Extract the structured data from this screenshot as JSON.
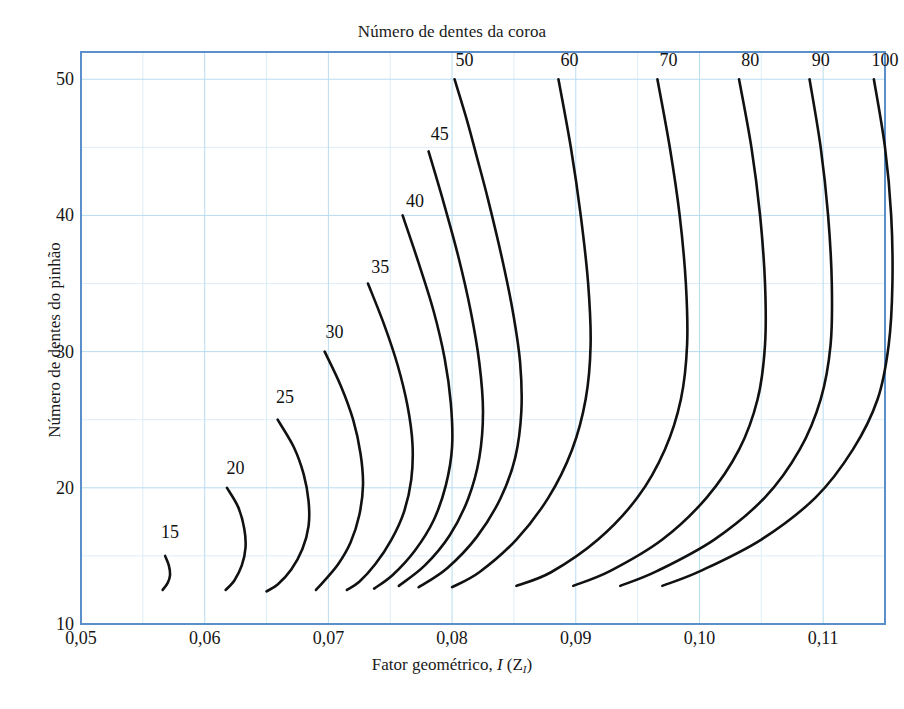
{
  "chart_data": {
    "type": "line",
    "title": "Número de dentes da coroa",
    "xlabel": "Fator geométrico, I (Z_I)",
    "ylabel": "Número de dentes do pinhão",
    "xlim": [
      0.05,
      0.115
    ],
    "ylim": [
      10,
      52
    ],
    "grid": true,
    "legend": "inline-curve-labels",
    "x_ticks": [
      "0,05",
      "0,06",
      "0,07",
      "0,08",
      "0,09",
      "0,10",
      "0,11"
    ],
    "x_tick_values": [
      0.05,
      0.06,
      0.07,
      0.08,
      0.09,
      0.1,
      0.11
    ],
    "y_ticks": [
      "10",
      "20",
      "30",
      "40",
      "50"
    ],
    "y_tick_values": [
      10,
      20,
      30,
      40,
      50
    ],
    "x_minor_step": 0.005,
    "y_minor_step": 5,
    "series": [
      {
        "name": "15",
        "label": "15",
        "label_x": 0.0572,
        "label_y": 16.6,
        "points": [
          [
            0.0568,
            15.0
          ],
          [
            0.0571,
            14.3
          ],
          [
            0.0572,
            13.6
          ],
          [
            0.057,
            13.0
          ],
          [
            0.0566,
            12.5
          ]
        ]
      },
      {
        "name": "20",
        "label": "20",
        "label_x": 0.0625,
        "label_y": 21.3,
        "points": [
          [
            0.0618,
            20.0
          ],
          [
            0.0627,
            18.6
          ],
          [
            0.0632,
            17.0
          ],
          [
            0.0633,
            15.6
          ],
          [
            0.063,
            14.3
          ],
          [
            0.0624,
            13.2
          ],
          [
            0.0617,
            12.5
          ]
        ]
      },
      {
        "name": "25",
        "label": "25",
        "label_x": 0.0665,
        "label_y": 26.5,
        "points": [
          [
            0.0659,
            25.0
          ],
          [
            0.0672,
            23.0
          ],
          [
            0.068,
            21.0
          ],
          [
            0.0684,
            19.0
          ],
          [
            0.0684,
            17.2
          ],
          [
            0.0679,
            15.5
          ],
          [
            0.067,
            14.0
          ],
          [
            0.0659,
            12.9
          ],
          [
            0.065,
            12.4
          ]
        ]
      },
      {
        "name": "30",
        "label": "30",
        "label_x": 0.0705,
        "label_y": 31.3,
        "points": [
          [
            0.0697,
            30.0
          ],
          [
            0.071,
            27.5
          ],
          [
            0.072,
            25.0
          ],
          [
            0.0726,
            22.5
          ],
          [
            0.0728,
            20.2
          ],
          [
            0.0725,
            18.0
          ],
          [
            0.0718,
            16.0
          ],
          [
            0.0708,
            14.4
          ],
          [
            0.0697,
            13.2
          ],
          [
            0.069,
            12.5
          ]
        ]
      },
      {
        "name": "35",
        "label": "35",
        "label_x": 0.0742,
        "label_y": 36.1,
        "points": [
          [
            0.0732,
            35.0
          ],
          [
            0.0745,
            32.0
          ],
          [
            0.0756,
            29.0
          ],
          [
            0.0764,
            26.0
          ],
          [
            0.0768,
            23.2
          ],
          [
            0.0767,
            20.6
          ],
          [
            0.0761,
            18.2
          ],
          [
            0.0751,
            16.2
          ],
          [
            0.0738,
            14.4
          ],
          [
            0.0725,
            13.1
          ],
          [
            0.0715,
            12.5
          ]
        ]
      },
      {
        "name": "40",
        "label": "40",
        "label_x": 0.077,
        "label_y": 40.9,
        "points": [
          [
            0.076,
            40.0
          ],
          [
            0.0773,
            36.5
          ],
          [
            0.0785,
            33.0
          ],
          [
            0.0794,
            29.5
          ],
          [
            0.0799,
            26.2
          ],
          [
            0.08,
            23.0
          ],
          [
            0.0795,
            20.2
          ],
          [
            0.0785,
            17.6
          ],
          [
            0.077,
            15.4
          ],
          [
            0.0752,
            13.6
          ],
          [
            0.0737,
            12.6
          ]
        ]
      },
      {
        "name": "45",
        "label": "45",
        "label_x": 0.079,
        "label_y": 45.8,
        "points": [
          [
            0.0781,
            44.7
          ],
          [
            0.0793,
            41.0
          ],
          [
            0.0805,
            37.0
          ],
          [
            0.0815,
            33.0
          ],
          [
            0.0822,
            29.2
          ],
          [
            0.0825,
            25.6
          ],
          [
            0.0822,
            22.2
          ],
          [
            0.0813,
            19.2
          ],
          [
            0.0798,
            16.5
          ],
          [
            0.0778,
            14.3
          ],
          [
            0.0757,
            12.8
          ]
        ]
      },
      {
        "name": "50",
        "label": "50",
        "label_x": 0.081,
        "label_y": 51.3,
        "points": [
          [
            0.0802,
            50.0
          ],
          [
            0.0812,
            47.0
          ],
          [
            0.082,
            44.3
          ],
          [
            0.0829,
            41.2
          ],
          [
            0.084,
            37.0
          ],
          [
            0.0849,
            33.0
          ],
          [
            0.0855,
            29.2
          ],
          [
            0.0856,
            25.6
          ],
          [
            0.0851,
            22.2
          ],
          [
            0.0839,
            19.2
          ],
          [
            0.082,
            16.4
          ],
          [
            0.0796,
            14.1
          ],
          [
            0.0773,
            12.7
          ]
        ]
      },
      {
        "name": "60",
        "label": "60",
        "label_x": 0.0895,
        "label_y": 51.3,
        "points": [
          [
            0.0886,
            50.0
          ],
          [
            0.0896,
            45.0
          ],
          [
            0.0904,
            40.0
          ],
          [
            0.091,
            35.0
          ],
          [
            0.0912,
            30.5
          ],
          [
            0.0908,
            26.5
          ],
          [
            0.0897,
            22.8
          ],
          [
            0.0878,
            19.3
          ],
          [
            0.0852,
            16.2
          ],
          [
            0.0822,
            13.8
          ],
          [
            0.08,
            12.7
          ]
        ]
      },
      {
        "name": "70",
        "label": "70",
        "label_x": 0.0975,
        "label_y": 51.3,
        "points": [
          [
            0.0966,
            50.0
          ],
          [
            0.0976,
            45.0
          ],
          [
            0.0984,
            40.0
          ],
          [
            0.0989,
            35.0
          ],
          [
            0.099,
            30.5
          ],
          [
            0.0985,
            26.5
          ],
          [
            0.0972,
            22.8
          ],
          [
            0.095,
            19.3
          ],
          [
            0.0918,
            16.2
          ],
          [
            0.088,
            13.8
          ],
          [
            0.0852,
            12.8
          ]
        ]
      },
      {
        "name": "80",
        "label": "80",
        "label_x": 0.1041,
        "label_y": 51.3,
        "points": [
          [
            0.1032,
            50.0
          ],
          [
            0.1042,
            45.0
          ],
          [
            0.1049,
            40.0
          ],
          [
            0.1053,
            35.0
          ],
          [
            0.1053,
            30.5
          ],
          [
            0.1047,
            26.5
          ],
          [
            0.1032,
            22.8
          ],
          [
            0.1006,
            19.3
          ],
          [
            0.097,
            16.2
          ],
          [
            0.0928,
            13.9
          ],
          [
            0.0898,
            12.8
          ]
        ]
      },
      {
        "name": "90",
        "label": "90",
        "label_x": 0.1098,
        "label_y": 51.3,
        "points": [
          [
            0.1089,
            50.0
          ],
          [
            0.1098,
            45.0
          ],
          [
            0.1104,
            40.0
          ],
          [
            0.1107,
            35.0
          ],
          [
            0.1106,
            30.5
          ],
          [
            0.1098,
            26.5
          ],
          [
            0.1081,
            22.8
          ],
          [
            0.1053,
            19.3
          ],
          [
            0.1012,
            16.2
          ],
          [
            0.0966,
            13.9
          ],
          [
            0.0936,
            12.8
          ]
        ]
      },
      {
        "name": "100",
        "label": "100",
        "label_x": 0.115,
        "label_y": 51.3,
        "points": [
          [
            0.1141,
            50.0
          ],
          [
            0.115,
            45.0
          ],
          [
            0.1155,
            40.0
          ],
          [
            0.1156,
            35.0
          ],
          [
            0.1153,
            30.5
          ],
          [
            0.1144,
            26.5
          ],
          [
            0.1124,
            22.8
          ],
          [
            0.1094,
            19.3
          ],
          [
            0.105,
            16.2
          ],
          [
            0.1001,
            13.9
          ],
          [
            0.097,
            12.8
          ]
        ]
      }
    ]
  },
  "style": {
    "axis_color": "#5b8fc9",
    "grid_major_color": "#b9dcf0",
    "grid_minor_color": "#ddeef8",
    "curve_color": "#111111",
    "text_color": "#1a1a1a",
    "background": "#ffffff"
  },
  "axis_titles": {
    "top": "Número de dentes da coroa",
    "x_main": "Fator geométrico,",
    "x_symbol": "I",
    "x_paren_open": "(Z",
    "x_sub": "I",
    "x_paren_close": ")",
    "y": "Número de dentes do pinhão"
  }
}
